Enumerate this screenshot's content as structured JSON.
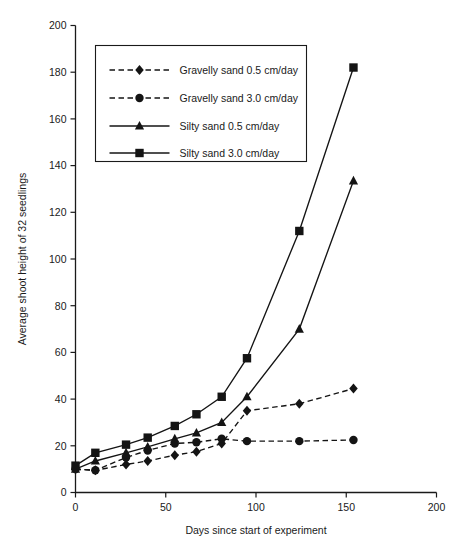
{
  "chart_data": {
    "type": "line",
    "title": "",
    "xlabel": "Days since start of experiment",
    "ylabel": "Average shoot height of 32 seedlings",
    "xlim": [
      0,
      200
    ],
    "ylim": [
      0,
      200
    ],
    "xticks": [
      0,
      50,
      100,
      150,
      200
    ],
    "yticks": [
      0,
      20,
      40,
      60,
      80,
      100,
      120,
      140,
      160,
      180,
      200
    ],
    "xtick_labels": [
      "0",
      "50",
      "100",
      "150",
      "200"
    ],
    "ytick_labels": [
      "0",
      "20",
      "40",
      "60",
      "80",
      "100",
      "120",
      "140",
      "160",
      "180",
      "200"
    ],
    "grid": false,
    "legend_position": "upper left",
    "series": [
      {
        "name": "Gravelly sand 0.5 cm/day",
        "marker": "diamond",
        "linestyle": "dashed",
        "color": "#141414",
        "x": [
          0,
          11,
          28,
          40,
          55,
          67,
          81,
          95,
          124,
          154
        ],
        "y": [
          10,
          9.5,
          12,
          13.5,
          16,
          17.5,
          21,
          35,
          38,
          44.5
        ]
      },
      {
        "name": "Gravelly sand 3.0 cm/day",
        "marker": "circle",
        "linestyle": "dashed",
        "color": "#141414",
        "x": [
          0,
          11,
          28,
          40,
          55,
          67,
          81,
          95,
          124,
          154
        ],
        "y": [
          10,
          9.5,
          15,
          18,
          21,
          21.5,
          23,
          22,
          22,
          22.5
        ]
      },
      {
        "name": "Silty sand 0.5 cm/day",
        "marker": "triangle",
        "linestyle": "solid",
        "color": "#141414",
        "x": [
          0,
          11,
          28,
          40,
          55,
          67,
          81,
          95,
          124,
          154
        ],
        "y": [
          10,
          13.5,
          17,
          19.5,
          23,
          25.5,
          30,
          41,
          70,
          133.5
        ]
      },
      {
        "name": "Silty sand 3.0 cm/day",
        "marker": "square",
        "linestyle": "solid",
        "color": "#141414",
        "x": [
          0,
          11,
          28,
          40,
          55,
          67,
          81,
          95,
          124,
          154
        ],
        "y": [
          11.5,
          17,
          20.5,
          23.5,
          28.5,
          33.5,
          41,
          57.5,
          112,
          182
        ]
      }
    ],
    "legend_entries": [
      "Gravelly sand 0.5 cm/day",
      "Gravelly sand 3.0 cm/day",
      "Silty sand 0.5 cm/day",
      "Silty sand 3.0 cm/day"
    ]
  }
}
